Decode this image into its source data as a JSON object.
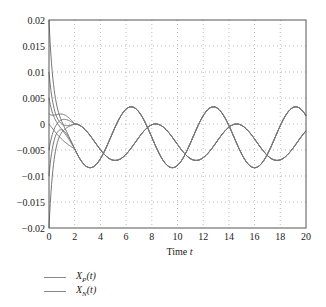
{
  "chart_data": {
    "type": "line",
    "title": "",
    "xlabel": "Time t",
    "ylabel": "",
    "xlim": [
      0,
      20
    ],
    "ylim": [
      -0.02,
      0.02
    ],
    "grid": true,
    "x_ticks": [
      "0",
      "2",
      "4",
      "6",
      "8",
      "10",
      "12",
      "14",
      "16",
      "18",
      "20"
    ],
    "y_ticks": [
      "0.02",
      "0.015",
      "0.01",
      "0.005",
      "0",
      "-0.005",
      "-0.01",
      "-0.015",
      "-0.02"
    ],
    "legend_position": "below-left",
    "transient_initial_values": [
      0.02,
      0.01,
      0.005,
      0.002,
      0.0,
      -0.005,
      -0.01,
      -0.02
    ],
    "transient_converge_point": {
      "t": 2.0,
      "value": 0.0
    },
    "series": [
      {
        "name": "X_P(t)",
        "description": "steady-state oscillation after transient",
        "peaks": [
          {
            "t": 6.4,
            "value": 0.0033
          },
          {
            "t": 13.0,
            "value": 0.0033
          },
          {
            "t": 19.4,
            "value": 0.0033
          }
        ],
        "troughs": [
          {
            "t": 5.4,
            "value": -0.0084
          },
          {
            "t": 11.7,
            "value": -0.0084
          },
          {
            "t": 18.0,
            "value": -0.0084
          }
        ],
        "mean": -0.00255,
        "amplitude": 0.00585,
        "period": 6.4
      },
      {
        "name": "X_N(t)",
        "description": "steady-state oscillation after transient",
        "peaks": [
          {
            "t": 8.3,
            "value": 0.0
          },
          {
            "t": 14.6,
            "value": 0.0
          }
        ],
        "troughs": [
          {
            "t": 3.8,
            "value": -0.007
          },
          {
            "t": 10.1,
            "value": -0.007
          },
          {
            "t": 16.4,
            "value": -0.007
          }
        ],
        "mean": -0.0035,
        "amplitude": 0.0035,
        "period": 6.3
      }
    ]
  },
  "legend": {
    "items": [
      {
        "base": "X",
        "sub": "P",
        "suffix": "(t)"
      },
      {
        "base": "X",
        "sub": "N",
        "suffix": "(t)"
      }
    ]
  },
  "axis": {
    "xlabel_text": "Time ",
    "xlabel_var": "t"
  }
}
